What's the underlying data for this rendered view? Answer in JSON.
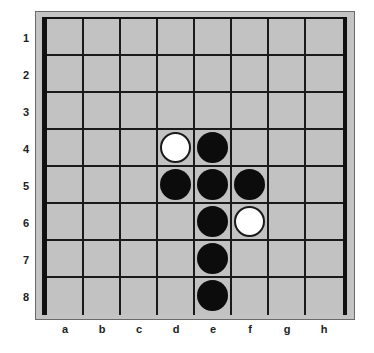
{
  "board": {
    "rows": [
      "1",
      "2",
      "3",
      "4",
      "5",
      "6",
      "7",
      "8"
    ],
    "columns": [
      "a",
      "b",
      "c",
      "d",
      "e",
      "f",
      "g",
      "h"
    ],
    "colors": {
      "board": "#c2c2c2",
      "frame": "#c4c4c4",
      "grid": "#1a1a1a",
      "black": "#0c0c0c",
      "white": "#ffffff"
    },
    "pieces": [
      {
        "square": "d4",
        "color": "white"
      },
      {
        "square": "e4",
        "color": "black"
      },
      {
        "square": "d5",
        "color": "black"
      },
      {
        "square": "e5",
        "color": "black"
      },
      {
        "square": "f5",
        "color": "black"
      },
      {
        "square": "e6",
        "color": "black"
      },
      {
        "square": "f6",
        "color": "white"
      },
      {
        "square": "e7",
        "color": "black"
      },
      {
        "square": "e8",
        "color": "black"
      }
    ]
  }
}
